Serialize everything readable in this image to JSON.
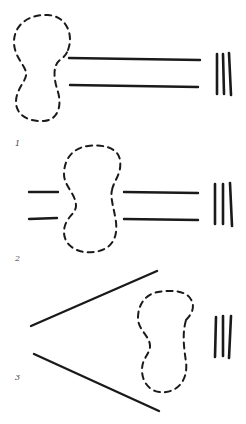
{
  "figure": {
    "panels": [
      {
        "label": "1",
        "description": "Dashed blob at left end of two parallel lines, three vertical bars at right"
      },
      {
        "label": "2",
        "description": "Dashed blob between two pairs of parallel line segments, three vertical bars at right"
      },
      {
        "label": "3",
        "description": "Two diverging lines forming a V opening right, dashed blob inside the opening, three vertical bars at right"
      }
    ],
    "colors": {
      "ink": "#1a1a1a",
      "label": "#444444",
      "background": "#ffffff"
    }
  }
}
